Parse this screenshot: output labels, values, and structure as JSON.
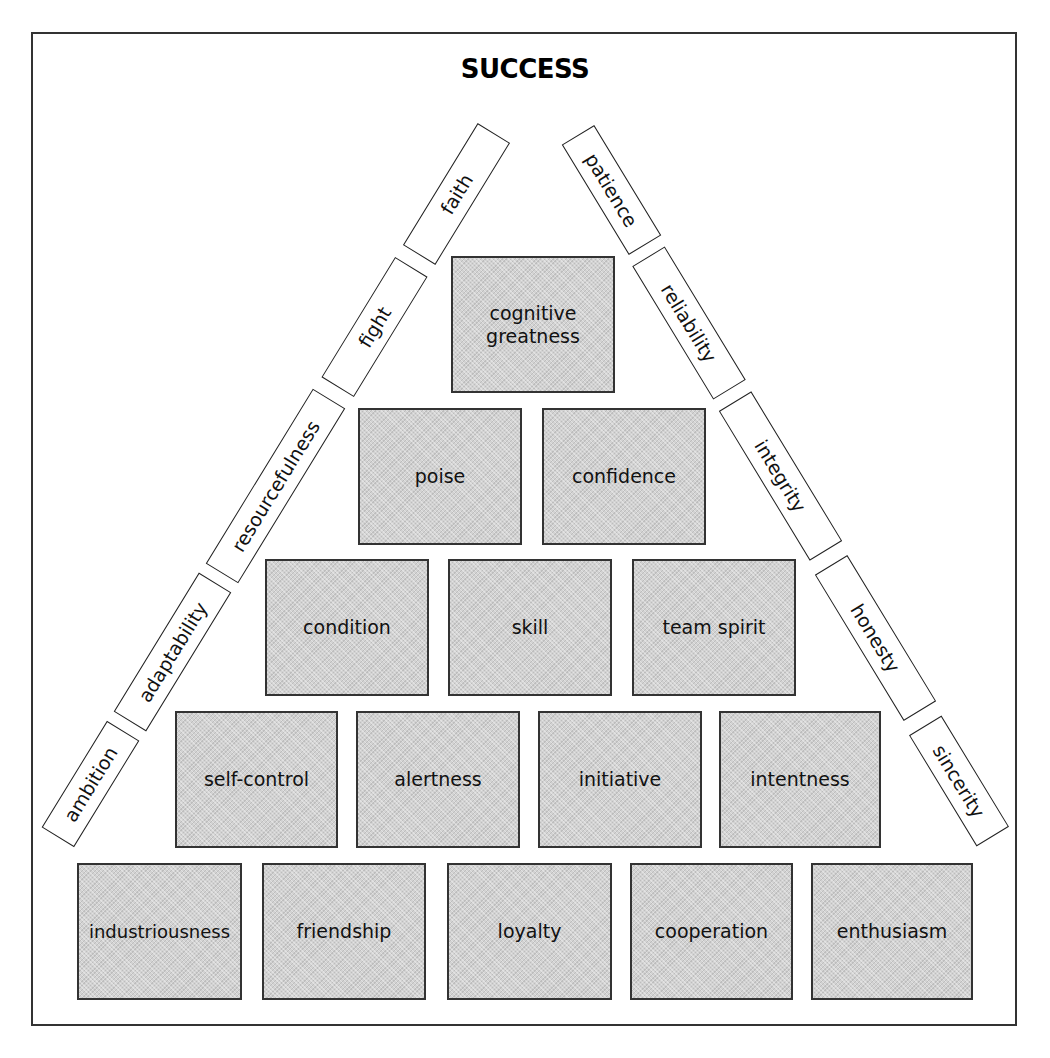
{
  "title": "SUCCESS",
  "pyramid": {
    "row1": [
      "cognitive greatness"
    ],
    "row2": [
      "poise",
      "confidence"
    ],
    "row3": [
      "condition",
      "skill",
      "team spirit"
    ],
    "row4": [
      "self-control",
      "alertness",
      "initiative",
      "intentness"
    ],
    "row5": [
      "industriousness",
      "friendship",
      "loyalty",
      "cooperation",
      "enthusiasm"
    ]
  },
  "left_side": [
    "faith",
    "fight",
    "resourcefulness",
    "adaptability",
    "ambition"
  ],
  "right_side": [
    "patience",
    "reliability",
    "integrity",
    "honesty",
    "sincerity"
  ],
  "colors": {
    "block_fill": "#d2d2d2",
    "border": "#333333",
    "background": "#ffffff"
  }
}
